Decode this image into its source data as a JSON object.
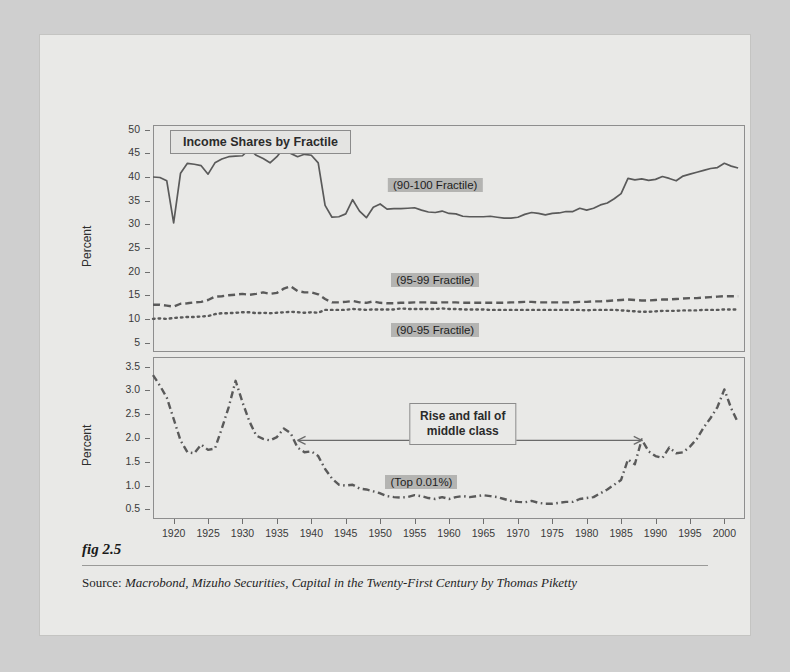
{
  "figure": {
    "fig_label": "fig 2.5",
    "source_prefix": "Source:",
    "source_text": "Macrobond, Mizuho Securities, Capital in the Twenty-First Century by Thomas Piketty"
  },
  "chart_data": {
    "type": "line",
    "title": "Income Shares by Fractile",
    "panels": [
      {
        "id": "top",
        "ylabel": "Percent",
        "ylim": [
          3,
          51
        ],
        "yticks": [
          5,
          10,
          15,
          20,
          25,
          30,
          35,
          40,
          45,
          50
        ],
        "ytick_labels": [
          "5",
          "10",
          "15",
          "20",
          "25",
          "30",
          "35",
          "40",
          "45",
          "50"
        ],
        "xlim": [
          1917,
          2003
        ],
        "grid": false,
        "series": [
          {
            "name": "(90-100 Fractile)",
            "style": "solid",
            "label_x": 1958,
            "label_y": 38.4,
            "x": [
              1917,
              1918,
              1919,
              1920,
              1921,
              1922,
              1923,
              1924,
              1925,
              1926,
              1927,
              1928,
              1929,
              1930,
              1931,
              1932,
              1933,
              1934,
              1935,
              1936,
              1937,
              1938,
              1939,
              1940,
              1941,
              1942,
              1943,
              1944,
              1945,
              1946,
              1947,
              1948,
              1949,
              1950,
              1951,
              1952,
              1953,
              1954,
              1955,
              1956,
              1957,
              1958,
              1959,
              1960,
              1961,
              1962,
              1963,
              1964,
              1965,
              1966,
              1967,
              1968,
              1969,
              1970,
              1971,
              1972,
              1973,
              1974,
              1975,
              1976,
              1977,
              1978,
              1979,
              1980,
              1981,
              1982,
              1983,
              1984,
              1985,
              1986,
              1987,
              1988,
              1989,
              1990,
              1991,
              1992,
              1993,
              1994,
              1995,
              1996,
              1997,
              1998,
              1999,
              2000,
              2001,
              2002
            ],
            "y": [
              40.0,
              39.9,
              39.2,
              30.3,
              40.8,
              42.9,
              42.7,
              42.4,
              40.6,
              43.0,
              43.8,
              44.3,
              44.4,
              44.5,
              45.9,
              44.6,
              43.9,
              43.0,
              44.3,
              46.2,
              45.0,
              44.3,
              44.8,
              44.6,
              43.0,
              34.0,
              31.5,
              31.6,
              32.2,
              35.2,
              32.8,
              31.4,
              33.6,
              34.3,
              33.2,
              33.3,
              33.3,
              33.4,
              33.5,
              33.0,
              32.6,
              32.5,
              32.8,
              32.3,
              32.2,
              31.7,
              31.6,
              31.6,
              31.6,
              31.7,
              31.5,
              31.3,
              31.3,
              31.5,
              32.1,
              32.5,
              32.3,
              32.0,
              32.3,
              32.4,
              32.7,
              32.7,
              33.4,
              33.0,
              33.4,
              34.1,
              34.5,
              35.4,
              36.5,
              39.7,
              39.4,
              39.6,
              39.3,
              39.5,
              40.1,
              39.7,
              39.2,
              40.2,
              40.6,
              41.0,
              41.4,
              41.8,
              42.0,
              42.9,
              42.3,
              41.9
            ]
          },
          {
            "name": "(95-99 Fractile)",
            "style": "dashed",
            "label_x": 1958,
            "label_y": 18.2,
            "x": [
              1917,
              1918,
              1919,
              1920,
              1921,
              1922,
              1923,
              1924,
              1925,
              1926,
              1927,
              1928,
              1929,
              1930,
              1931,
              1932,
              1933,
              1934,
              1935,
              1936,
              1937,
              1938,
              1939,
              1940,
              1941,
              1942,
              1943,
              1944,
              1945,
              1946,
              1947,
              1948,
              1949,
              1950,
              1951,
              1952,
              1953,
              1954,
              1955,
              1956,
              1957,
              1958,
              1959,
              1960,
              1961,
              1962,
              1963,
              1964,
              1965,
              1966,
              1967,
              1968,
              1969,
              1970,
              1971,
              1972,
              1973,
              1974,
              1975,
              1976,
              1977,
              1978,
              1979,
              1980,
              1981,
              1982,
              1983,
              1984,
              1985,
              1986,
              1987,
              1988,
              1989,
              1990,
              1991,
              1992,
              1993,
              1994,
              1995,
              1996,
              1997,
              1998,
              1999,
              2000,
              2001,
              2002
            ],
            "y": [
              13.0,
              13.0,
              12.8,
              12.6,
              13.2,
              13.3,
              13.5,
              13.6,
              14.0,
              14.7,
              14.8,
              15.0,
              15.1,
              15.3,
              15.1,
              15.3,
              15.6,
              15.3,
              15.5,
              16.4,
              16.9,
              15.9,
              15.6,
              15.6,
              15.2,
              14.2,
              13.5,
              13.5,
              13.6,
              13.8,
              13.5,
              13.4,
              13.7,
              13.4,
              13.3,
              13.3,
              13.4,
              13.4,
              13.5,
              13.5,
              13.5,
              13.4,
              13.5,
              13.5,
              13.5,
              13.4,
              13.4,
              13.4,
              13.4,
              13.4,
              13.4,
              13.4,
              13.5,
              13.5,
              13.6,
              13.6,
              13.5,
              13.5,
              13.5,
              13.5,
              13.5,
              13.5,
              13.6,
              13.6,
              13.7,
              13.7,
              13.8,
              13.9,
              14.0,
              14.1,
              14.0,
              13.9,
              13.9,
              14.0,
              14.1,
              14.1,
              14.2,
              14.3,
              14.4,
              14.4,
              14.5,
              14.6,
              14.7,
              14.8,
              14.8,
              14.8
            ]
          },
          {
            "name": "(90-95 Fractile)",
            "style": "dotted",
            "label_x": 1958,
            "label_y": 7.6,
            "x": [
              1917,
              1918,
              1919,
              1920,
              1921,
              1922,
              1923,
              1924,
              1925,
              1926,
              1927,
              1928,
              1929,
              1930,
              1931,
              1932,
              1933,
              1934,
              1935,
              1936,
              1937,
              1938,
              1939,
              1940,
              1941,
              1942,
              1943,
              1944,
              1945,
              1946,
              1947,
              1948,
              1949,
              1950,
              1951,
              1952,
              1953,
              1954,
              1955,
              1956,
              1957,
              1958,
              1959,
              1960,
              1961,
              1962,
              1963,
              1964,
              1965,
              1966,
              1967,
              1968,
              1969,
              1970,
              1971,
              1972,
              1973,
              1974,
              1975,
              1976,
              1977,
              1978,
              1979,
              1980,
              1981,
              1982,
              1983,
              1984,
              1985,
              1986,
              1987,
              1988,
              1989,
              1990,
              1991,
              1992,
              1993,
              1994,
              1995,
              1996,
              1997,
              1998,
              1999,
              2000,
              2001,
              2002
            ],
            "y": [
              10.0,
              10.1,
              10.0,
              10.2,
              10.3,
              10.4,
              10.4,
              10.5,
              10.6,
              11.0,
              11.2,
              11.2,
              11.3,
              11.4,
              11.4,
              11.2,
              11.3,
              11.2,
              11.3,
              11.4,
              11.5,
              11.4,
              11.3,
              11.4,
              11.3,
              11.9,
              11.9,
              11.9,
              11.9,
              12.1,
              12.0,
              11.9,
              12.0,
              12.0,
              12.0,
              12.0,
              12.2,
              12.1,
              12.1,
              12.1,
              12.1,
              12.1,
              12.2,
              12.1,
              12.1,
              12.0,
              12.0,
              12.0,
              12.0,
              11.9,
              11.9,
              11.9,
              11.9,
              11.9,
              11.9,
              11.9,
              11.9,
              11.9,
              11.9,
              11.9,
              11.9,
              11.9,
              11.9,
              11.8,
              11.9,
              11.9,
              11.9,
              11.9,
              11.8,
              11.7,
              11.6,
              11.5,
              11.5,
              11.6,
              11.7,
              11.7,
              11.7,
              11.8,
              11.8,
              11.8,
              11.9,
              11.9,
              11.9,
              12.0,
              12.0,
              12.0
            ]
          }
        ]
      },
      {
        "id": "bottom",
        "ylabel": "Percent",
        "ylim": [
          0.3,
          3.7
        ],
        "yticks": [
          0.5,
          1.0,
          1.5,
          2.0,
          2.5,
          3.0,
          3.5
        ],
        "ytick_labels": [
          "0.5",
          "1.0",
          "1.5",
          "2.0",
          "2.5",
          "3.0",
          "3.5"
        ],
        "xlim": [
          1917,
          2003
        ],
        "grid": false,
        "series": [
          {
            "name": "(Top 0.01%)",
            "style": "dashdot",
            "label_x": 1956,
            "label_y": 1.07,
            "x": [
              1917,
              1918,
              1919,
              1920,
              1921,
              1922,
              1923,
              1924,
              1925,
              1926,
              1927,
              1928,
              1929,
              1930,
              1931,
              1932,
              1933,
              1934,
              1935,
              1936,
              1937,
              1938,
              1939,
              1940,
              1941,
              1942,
              1943,
              1944,
              1945,
              1946,
              1947,
              1948,
              1949,
              1950,
              1951,
              1952,
              1953,
              1954,
              1955,
              1956,
              1957,
              1958,
              1959,
              1960,
              1961,
              1962,
              1963,
              1964,
              1965,
              1966,
              1967,
              1968,
              1969,
              1970,
              1971,
              1972,
              1973,
              1974,
              1975,
              1976,
              1977,
              1978,
              1979,
              1980,
              1981,
              1982,
              1983,
              1984,
              1985,
              1986,
              1987,
              1988,
              1989,
              1990,
              1991,
              1992,
              1993,
              1994,
              1995,
              1996,
              1997,
              1998,
              1999,
              2000,
              2001,
              2002
            ],
            "y": [
              3.32,
              3.1,
              2.85,
              2.4,
              1.95,
              1.7,
              1.68,
              1.86,
              1.75,
              1.78,
              2.2,
              2.65,
              3.2,
              2.75,
              2.35,
              2.05,
              1.98,
              1.95,
              2.02,
              2.2,
              2.1,
              1.8,
              1.7,
              1.72,
              1.62,
              1.35,
              1.15,
              1.02,
              1.0,
              1.02,
              0.94,
              0.92,
              0.88,
              0.84,
              0.78,
              0.76,
              0.75,
              0.76,
              0.8,
              0.78,
              0.74,
              0.72,
              0.76,
              0.72,
              0.76,
              0.78,
              0.76,
              0.78,
              0.8,
              0.78,
              0.76,
              0.72,
              0.68,
              0.66,
              0.65,
              0.68,
              0.64,
              0.62,
              0.62,
              0.64,
              0.66,
              0.66,
              0.72,
              0.74,
              0.76,
              0.84,
              0.92,
              1.02,
              1.12,
              1.55,
              1.45,
              1.97,
              1.72,
              1.62,
              1.58,
              1.8,
              1.68,
              1.7,
              1.82,
              1.98,
              2.22,
              2.42,
              2.65,
              3.02,
              2.62,
              2.32
            ]
          }
        ]
      }
    ],
    "annotations": [
      {
        "name": "middle-class-callout",
        "text_line1": "Rise and fall of",
        "text_line2": "middle class"
      }
    ]
  },
  "xaxis": {
    "ticks": [
      1920,
      1925,
      1930,
      1935,
      1940,
      1945,
      1950,
      1955,
      1960,
      1965,
      1970,
      1975,
      1980,
      1985,
      1990,
      1995,
      2000
    ]
  },
  "colors": {
    "page_background": "#e9e9e7",
    "outer_background": "#cfcfcf",
    "line": "#5a5a5a",
    "frame": "#8e8e8e",
    "tag_background": "#b4b4b2",
    "text": "#2b2b2b"
  }
}
